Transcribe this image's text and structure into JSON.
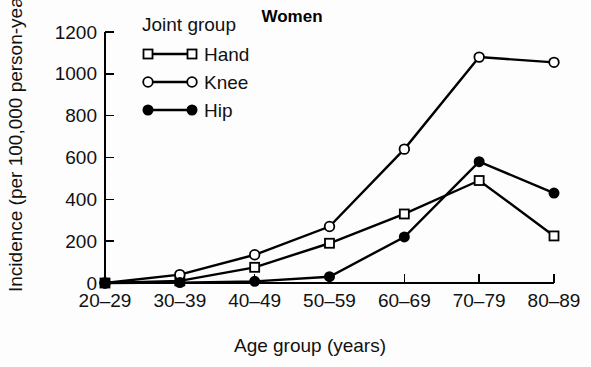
{
  "chart_data": {
    "type": "line",
    "title": "Women",
    "xlabel": "Age group (years)",
    "ylabel": "Incidence (per 100,000 person-years)",
    "categories": [
      "20–29",
      "30–39",
      "40–49",
      "50–59",
      "60–69",
      "70–79",
      "80–89"
    ],
    "ylim": [
      0,
      1200
    ],
    "yticks": [
      0,
      200,
      400,
      600,
      800,
      1000,
      1200
    ],
    "ytick_labels": [
      "0",
      "200",
      "400",
      "600",
      "800",
      "1000",
      "1200"
    ],
    "grid": false,
    "legend_position": "top-left",
    "legend_title": "Joint group",
    "series": [
      {
        "name": "Hand",
        "marker": "open-square",
        "color": "#000000",
        "values": [
          0,
          10,
          75,
          190,
          330,
          490,
          225
        ]
      },
      {
        "name": "Knee",
        "marker": "open-circle",
        "color": "#000000",
        "values": [
          0,
          40,
          135,
          270,
          640,
          1080,
          1055
        ]
      },
      {
        "name": "Hip",
        "marker": "filled-circle",
        "color": "#000000",
        "values": [
          0,
          2,
          8,
          30,
          220,
          580,
          430
        ]
      }
    ]
  },
  "figure": {
    "background_color": "#ffffff",
    "axis_color": "#000000"
  }
}
